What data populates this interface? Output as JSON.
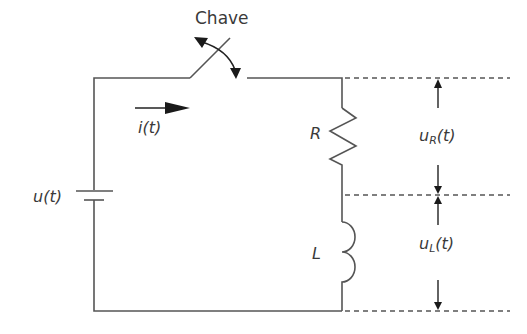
{
  "diagram": {
    "type": "RL series circuit",
    "labels": {
      "switch": "Chave",
      "current": "i(t)",
      "source": "u(t)",
      "resistor": "R",
      "inductor": "L",
      "voltage_resistor": {
        "base": "u",
        "sub": "R",
        "suffix": "(t)"
      },
      "voltage_inductor": {
        "base": "u",
        "sub": "L",
        "suffix": "(t)"
      }
    },
    "colors": {
      "line": "#555555",
      "text": "#3a3a3a",
      "arrow": "#1a1a1a"
    }
  }
}
